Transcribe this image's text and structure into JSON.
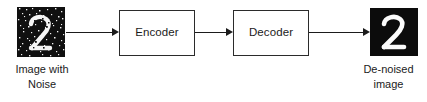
{
  "diagram": {
    "background_color": "#ffffff",
    "stroke_color": "#1b1b1b",
    "box_border_color": "#2b2b2b",
    "image_background_color": "#111111",
    "digit_color": "#ffffff"
  },
  "nodes": {
    "input_image": {
      "name": "noisy-digit-image",
      "digit": "2",
      "caption_line1": "Image with",
      "caption_line2": "Noise",
      "style": "noisy"
    },
    "encoder": {
      "label": "Encoder"
    },
    "decoder": {
      "label": "Decoder"
    },
    "output_image": {
      "name": "denoised-digit-image",
      "digit": "2",
      "caption_line1": "De-noised",
      "caption_line2": "image",
      "style": "clean"
    }
  },
  "edges": [
    {
      "id": "edge-input-to-encoder",
      "from": "input_image",
      "to": "encoder",
      "label": ""
    },
    {
      "id": "edge-encoder-to-decoder",
      "from": "encoder",
      "to": "decoder",
      "label": ""
    },
    {
      "id": "edge-decoder-to-output",
      "from": "decoder",
      "to": "output_image",
      "label": ""
    }
  ]
}
